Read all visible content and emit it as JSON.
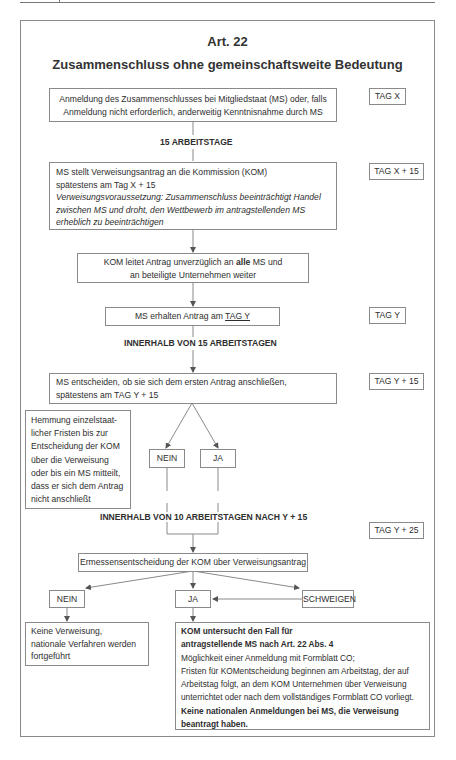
{
  "header": {
    "title": "Art. 22",
    "subtitle": "Zusammenschluss ohne gemeinschaftsweite Bedeutung"
  },
  "steps": {
    "s1": {
      "line1": "Anmeldung des Zusammenschlusses bei Mitgliedstaat (MS) oder, falls",
      "line2": "Anmeldung nicht erforderlich, anderweitig Kenntnisnahme durch MS",
      "tag": "TAG X"
    },
    "p1": "15 ARBEITSTAGE",
    "s2": {
      "line1": "MS stellt Verweisungsantrag an die Kommission (KOM)",
      "line2": "spätestens am Tag X + 15",
      "italic1": "Verweisungsvoraussetzung: Zusammenschluss beeinträchtigt Handel",
      "italic2": "zwischen MS und droht, den Wettbewerb im antragstellenden MS",
      "italic3": "erheblich zu beeinträchtigen",
      "tag": "TAG X + 15"
    },
    "s3": {
      "line1_pre": "KOM leitet Antrag unverzüglich an ",
      "line1_bold": "alle",
      "line1_post": " MS und",
      "line2": "an beteiligte Unternehmen weiter"
    },
    "s4": {
      "pre": "MS erhalten Antrag am ",
      "underlined": "TAG Y",
      "tag": "TAG Y"
    },
    "p2": "INNERHALB VON 15 ARBEITSTAGEN",
    "s5": {
      "line1": "MS entscheiden, ob sie sich dem ersten Antrag anschließen,",
      "line2": "spätestens am TAG Y + 15",
      "tag": "TAG Y + 15"
    },
    "note": [
      "Hemmung einzelstaat-",
      "licher Fristen bis zur",
      "Entscheidung der KOM",
      "über die Verweisung",
      "oder bis ein MS mitteilt,",
      "dass er sich dem Antrag",
      "nicht anschließt"
    ],
    "d1": {
      "no": "NEIN",
      "yes": "JA"
    },
    "p3": "INNERHALB VON 10 ARBEITSTAGEN NACH Y + 15",
    "tag_y25": "TAG Y + 25",
    "s6": "Ermessensentscheidung der KOM über Verweisungsantrag",
    "d2": {
      "no": "NEIN",
      "yes": "JA",
      "silence": "SCHWEIGEN"
    },
    "r_no": [
      "Keine Verweisung,",
      "nationale Verfahren werden",
      "fortgeführt"
    ],
    "r_yes": {
      "bold1": "KOM untersucht den Fall für",
      "bold2": "antragstellende MS nach Art. 22 Abs. 4",
      "lines": [
        "Möglichkeit einer Anmeldung mit Formblatt CO;",
        "Fristen für KOMentscheidung beginnen am Arbeitstag, der auf",
        "Arbeitstag folgt, an dem KOM Unternehmen über Verweisung",
        "unterrichtet oder nach dem vollständiges Formblatt CO vorliegt."
      ],
      "bold3": "Keine nationalen Anmeldungen bei MS, die Verweisung",
      "bold4": "beantragt haben."
    }
  }
}
